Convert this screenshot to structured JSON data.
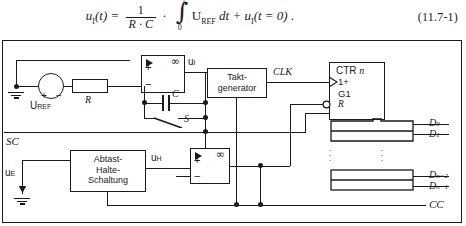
{
  "equation": {
    "lhs_u": "u",
    "lhs_sub": "I",
    "lhs_arg": "(t) =",
    "frac_num": "1",
    "frac_den": "R · C",
    "dot": "·",
    "int_upper": "t",
    "int_lower": "0",
    "integrand": "U",
    "integrand_sub": "REF",
    "differential": "dt",
    "plus": "+ u",
    "tail_sub": "I",
    "tail": "(t = 0) .",
    "number": "(11.7-1)"
  },
  "circuit": {
    "source_label": "U",
    "source_sub": "REF",
    "source_plus": "+",
    "source_minus": "−",
    "resistor_label": "R",
    "capacitor_label": "C",
    "switch_label": "S",
    "integrator_out_label": "u",
    "integrator_out_sub": "I",
    "opamp_infinity": "∞",
    "opamp_plus": "+",
    "opamp_minus": "−",
    "clock_block_line1": "Takt-",
    "clock_block_line2": "generator",
    "clock_signal": "CLK",
    "counter_title": "CTR",
    "counter_title_italic": "n",
    "counter_in_count": "1+",
    "counter_in_gate": "G1",
    "counter_in_reset": "R",
    "sample_hold_line1": "Abtast-",
    "sample_hold_line2": "Halte-",
    "sample_hold_line3": "Schaltung",
    "sample_hold_out": "u",
    "sample_hold_out_sub": "H",
    "input_label": "u",
    "input_sub": "E",
    "sc_label": "SC",
    "cc_label": "CC",
    "data_out_0": "D",
    "data_out_0_sub": "0",
    "data_out_1": "D",
    "data_out_1_sub": "1",
    "data_out_n2": "D",
    "data_out_n2_sub": "n−2",
    "data_out_n1": "D",
    "data_out_n1_sub": "n−1",
    "vertical_dots": "⋮"
  }
}
